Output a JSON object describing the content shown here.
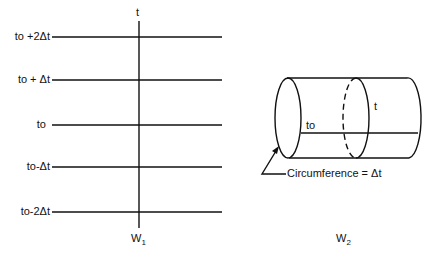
{
  "left_diagram": {
    "axis_label": "t",
    "space_label": "W",
    "space_subscript": "1",
    "time_lines": [
      {
        "label": "to +2Δt",
        "y": 37
      },
      {
        "label": "to + Δt",
        "y": 80
      },
      {
        "label": "to",
        "y": 125
      },
      {
        "label": "to-Δt",
        "y": 167
      },
      {
        "label": "to-2Δt",
        "y": 212
      }
    ]
  },
  "right_diagram": {
    "space_label": "W",
    "space_subscript": "2",
    "start_label": "to",
    "time_label": "t",
    "annotation": "Circumference = Δt"
  }
}
